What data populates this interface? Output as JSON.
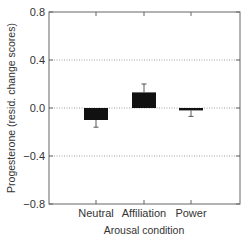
{
  "chart_data": {
    "type": "bar",
    "title": "",
    "xlabel": "Arousal condition",
    "ylabel": "Progesterone (resid. change scores)",
    "categories": [
      "Neutral",
      "Affiliation",
      "Power"
    ],
    "values": [
      -0.1,
      0.13,
      -0.02
    ],
    "error": [
      0.06,
      0.07,
      0.05
    ],
    "ylim": [
      -0.8,
      0.8
    ],
    "yticks": [
      0.8,
      0.4,
      0.0,
      -0.4,
      -0.8
    ],
    "ytick_labels": [
      "0.8",
      "0.4",
      "0.0",
      "−0.4",
      "−0.8"
    ],
    "grid": "horizontal dotted at 0.4, 0.0, -0.4",
    "legend": "none",
    "bar_color": "#111111"
  }
}
